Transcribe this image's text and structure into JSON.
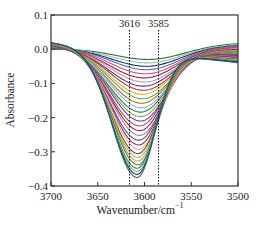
{
  "chart_data": {
    "type": "line",
    "title": "",
    "xlabel": "Wavenumber/cm",
    "xlabel_superscript": "−1",
    "ylabel": "Absorbance",
    "xlim": [
      3700,
      3500
    ],
    "ylim": [
      -0.4,
      0.1
    ],
    "x_reversed": true,
    "x_ticks": [
      3700,
      3650,
      3600,
      3550,
      3500
    ],
    "x_tick_labels": [
      "3700",
      "3650",
      "3600",
      "3550",
      "3500"
    ],
    "y_ticks": [
      0.1,
      0.0,
      -0.1,
      -0.2,
      -0.3,
      -0.4
    ],
    "y_tick_labels": [
      "0.1",
      "0.0",
      "−0.1",
      "−0.2",
      "−0.3",
      "−0.4"
    ],
    "grid": false,
    "legend": "none",
    "annotations": [
      {
        "label": "3616",
        "x": 3616,
        "style": "dotted vertical line"
      },
      {
        "label": "3585",
        "x": 3585,
        "style": "dotted vertical line"
      }
    ],
    "series_description": "Family of ~30 absorbance spectra with a negative band; band minimum near 3608 cm−1 deepening progressively from about −0.03 to −0.375",
    "series": [
      {
        "name": "s1",
        "min_x": 3596,
        "min_y": -0.03,
        "left_y": 0.0,
        "right_y": 0.018,
        "color": "#2e6e4e"
      },
      {
        "name": "s2",
        "min_x": 3597,
        "min_y": -0.04,
        "left_y": 0.002,
        "right_y": 0.015,
        "color": "#9ec48a"
      },
      {
        "name": "s3",
        "min_x": 3598,
        "min_y": -0.05,
        "left_y": 0.003,
        "right_y": 0.012,
        "color": "#1c2f6b"
      },
      {
        "name": "s4",
        "min_x": 3598,
        "min_y": -0.06,
        "left_y": 0.004,
        "right_y": 0.01,
        "color": "#4f6fb5"
      },
      {
        "name": "s5",
        "min_x": 3599,
        "min_y": -0.072,
        "left_y": 0.005,
        "right_y": 0.008,
        "color": "#c8527a"
      },
      {
        "name": "s6",
        "min_x": 3600,
        "min_y": -0.084,
        "left_y": 0.006,
        "right_y": 0.005,
        "color": "#8a2a40"
      },
      {
        "name": "s7",
        "min_x": 3600,
        "min_y": -0.096,
        "left_y": 0.007,
        "right_y": 0.003,
        "color": "#e08a9a"
      },
      {
        "name": "s8",
        "min_x": 3601,
        "min_y": -0.108,
        "left_y": 0.008,
        "right_y": 0.0,
        "color": "#3a3a8a"
      },
      {
        "name": "s9",
        "min_x": 3601,
        "min_y": -0.12,
        "left_y": 0.009,
        "right_y": -0.002,
        "color": "#c43030"
      },
      {
        "name": "s10",
        "min_x": 3602,
        "min_y": -0.132,
        "left_y": 0.01,
        "right_y": -0.004,
        "color": "#d4aa40"
      },
      {
        "name": "s11",
        "min_x": 3602,
        "min_y": -0.145,
        "left_y": 0.01,
        "right_y": -0.006,
        "color": "#5aa848"
      },
      {
        "name": "s12",
        "min_x": 3603,
        "min_y": -0.158,
        "left_y": 0.011,
        "right_y": -0.008,
        "color": "#b86a20"
      },
      {
        "name": "s13",
        "min_x": 3603,
        "min_y": -0.171,
        "left_y": 0.012,
        "right_y": -0.01,
        "color": "#7ab8d8"
      },
      {
        "name": "s14",
        "min_x": 3604,
        "min_y": -0.184,
        "left_y": 0.012,
        "right_y": -0.012,
        "color": "#2a7a5a"
      },
      {
        "name": "s15",
        "min_x": 3604,
        "min_y": -0.197,
        "left_y": 0.013,
        "right_y": -0.014,
        "color": "#9a9a3a"
      },
      {
        "name": "s16",
        "min_x": 3604,
        "min_y": -0.21,
        "left_y": 0.013,
        "right_y": -0.016,
        "color": "#4a4aa0"
      },
      {
        "name": "s17",
        "min_x": 3605,
        "min_y": -0.224,
        "left_y": 0.014,
        "right_y": -0.018,
        "color": "#b0405a"
      },
      {
        "name": "s18",
        "min_x": 3605,
        "min_y": -0.238,
        "left_y": 0.014,
        "right_y": -0.02,
        "color": "#7a2a60"
      },
      {
        "name": "s19",
        "min_x": 3605,
        "min_y": -0.252,
        "left_y": 0.015,
        "right_y": -0.022,
        "color": "#d06a80"
      },
      {
        "name": "s20",
        "min_x": 3606,
        "min_y": -0.266,
        "left_y": 0.015,
        "right_y": -0.024,
        "color": "#3a5a9a"
      },
      {
        "name": "s21",
        "min_x": 3606,
        "min_y": -0.28,
        "left_y": 0.016,
        "right_y": -0.026,
        "color": "#a03040"
      },
      {
        "name": "s22",
        "min_x": 3606,
        "min_y": -0.293,
        "left_y": 0.016,
        "right_y": -0.028,
        "color": "#e0a0b0"
      },
      {
        "name": "s23",
        "min_x": 3607,
        "min_y": -0.305,
        "left_y": 0.017,
        "right_y": -0.03,
        "color": "#6a4a2a"
      },
      {
        "name": "s24",
        "min_x": 3607,
        "min_y": -0.316,
        "left_y": 0.017,
        "right_y": -0.032,
        "color": "#9ab86a"
      },
      {
        "name": "s25",
        "min_x": 3607,
        "min_y": -0.327,
        "left_y": 0.018,
        "right_y": -0.034,
        "color": "#c8a050"
      },
      {
        "name": "s26",
        "min_x": 3607,
        "min_y": -0.338,
        "left_y": 0.018,
        "right_y": -0.035,
        "color": "#5a7a3a"
      },
      {
        "name": "s27",
        "min_x": 3608,
        "min_y": -0.348,
        "left_y": 0.019,
        "right_y": -0.036,
        "color": "#2a8a6a"
      },
      {
        "name": "s28",
        "min_x": 3608,
        "min_y": -0.357,
        "left_y": 0.019,
        "right_y": -0.037,
        "color": "#8ab848"
      },
      {
        "name": "s29",
        "min_x": 3608,
        "min_y": -0.366,
        "left_y": 0.02,
        "right_y": -0.038,
        "color": "#1a3a5a"
      },
      {
        "name": "s30",
        "min_x": 3608,
        "min_y": -0.375,
        "left_y": 0.02,
        "right_y": -0.04,
        "color": "#2a5a8a"
      }
    ]
  }
}
